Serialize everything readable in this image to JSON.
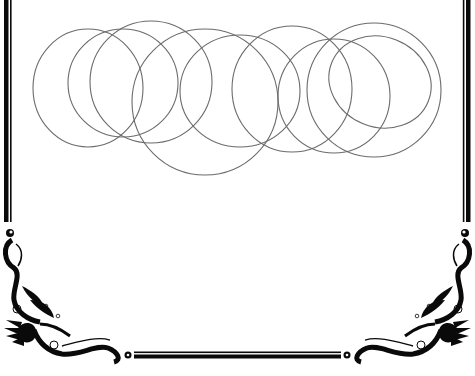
{
  "image": {
    "width": 475,
    "height": 376,
    "background": "#ffffff",
    "description": "Decorative frame with overlapping outline circles"
  },
  "colors": {
    "frame": "#0a0a0a",
    "circle_stroke": "#6b6b6b"
  },
  "frame": {
    "left_border": {
      "thick_x": 6,
      "thin_x": 10.5
    },
    "right_border": {
      "thick_x": 468,
      "thin_x": 463.5
    },
    "bottom_border": {
      "thin_y": 352.5,
      "thick_y": 356.5,
      "x_start": 135,
      "x_end": 340
    },
    "corner_ornaments": [
      "bottom-left-flourish",
      "bottom-right-flourish"
    ]
  },
  "circles": [
    {
      "cx": 88,
      "cy": 88,
      "rx": 55,
      "ry": 59,
      "rotate": 0
    },
    {
      "cx": 123,
      "cy": 83,
      "rx": 55,
      "ry": 54,
      "rotate": 0
    },
    {
      "cx": 151,
      "cy": 82,
      "rx": 61,
      "ry": 61,
      "rotate": 0
    },
    {
      "cx": 205,
      "cy": 102,
      "rx": 73,
      "ry": 73,
      "rotate": 0
    },
    {
      "cx": 240,
      "cy": 91,
      "rx": 60,
      "ry": 56,
      "rotate": 0
    },
    {
      "cx": 292,
      "cy": 89,
      "rx": 60,
      "ry": 63,
      "rotate": 0
    },
    {
      "cx": 334,
      "cy": 96,
      "rx": 56,
      "ry": 57,
      "rotate": 0
    },
    {
      "cx": 374,
      "cy": 90,
      "rx": 67,
      "ry": 67,
      "rotate": 0
    },
    {
      "cx": 380,
      "cy": 82,
      "rx": 52,
      "ry": 45,
      "rotate": 22
    }
  ]
}
